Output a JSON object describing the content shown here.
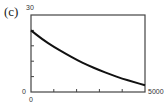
{
  "panel_label": "(c)",
  "chart_data": {
    "type": "line",
    "title": "",
    "xlabel": "",
    "ylabel": "",
    "xlim": [
      0,
      5000
    ],
    "ylim": [
      0,
      30
    ],
    "x_tick_labels": [
      "0",
      "5000"
    ],
    "y_tick_labels": [
      "0",
      "30"
    ],
    "x_ticks": [
      0,
      1000,
      2000,
      3000,
      4000,
      5000
    ],
    "y_ticks": [
      0,
      6,
      12,
      18,
      24,
      30
    ],
    "grid": false,
    "legend": null,
    "series": [
      {
        "name": "curve",
        "x": [
          0,
          500,
          1000,
          1500,
          2000,
          2500,
          3000,
          3500,
          4000,
          4500,
          5000
        ],
        "values": [
          24,
          20.5,
          17.6,
          15,
          12.5,
          10.4,
          8.5,
          6.8,
          5.2,
          3.9,
          2.6
        ]
      }
    ]
  },
  "axis": {
    "y_max_label": "30",
    "y_min_label": "0",
    "x_min_label": "0",
    "x_max_label": "5000"
  }
}
